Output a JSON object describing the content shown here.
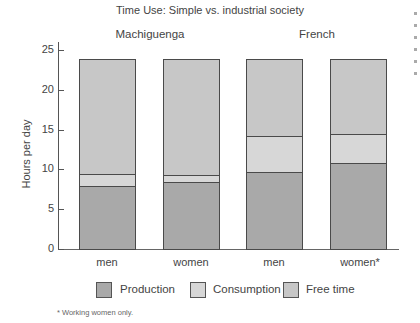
{
  "chart_data": {
    "type": "bar",
    "stacked": true,
    "title": "Time Use:  Simple vs. industrial society",
    "xlabel": "",
    "ylabel": "Hours per day",
    "ylim": [
      0,
      25
    ],
    "yticks": [
      0,
      5,
      10,
      15,
      20,
      25
    ],
    "groups": [
      {
        "name": "Machiguenga",
        "categories": [
          "men",
          "women"
        ]
      },
      {
        "name": "French",
        "categories": [
          "men",
          "women*"
        ]
      }
    ],
    "categories": [
      "Machiguenga men",
      "Machiguenga women",
      "French men",
      "French women*"
    ],
    "series": [
      {
        "name": "Production",
        "color": "#a9a9a9",
        "values": [
          7.8,
          8.3,
          9.6,
          10.7
        ]
      },
      {
        "name": "Consumption",
        "color": "#d7d7d7",
        "values": [
          1.5,
          0.9,
          4.5,
          3.7
        ]
      },
      {
        "name": "Free time",
        "color": "#c7c7c7",
        "values": [
          14.6,
          14.7,
          9.8,
          9.5
        ]
      }
    ],
    "totals": [
      24,
      24,
      24,
      24
    ],
    "legend_position": "bottom",
    "grid": false,
    "footnote": "* Working women only."
  },
  "labels": {
    "title": "Time Use:  Simple vs. industrial society",
    "group1": "Machiguenga",
    "group2": "French",
    "ylabel": "Hours per day",
    "yticks": [
      "0",
      "5",
      "10",
      "15",
      "20",
      "25"
    ],
    "cats": [
      "men",
      "women",
      "men",
      "women*"
    ],
    "legend": [
      "Production",
      "Consumption",
      "Free time"
    ],
    "footnote": "* Working women only."
  }
}
